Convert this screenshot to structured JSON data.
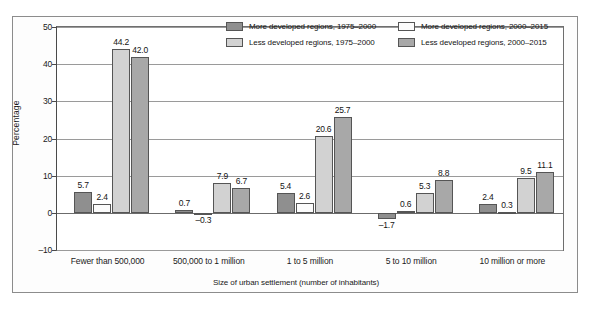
{
  "chart_data": {
    "type": "bar",
    "title": "",
    "xlabel": "Size of urban settlement (number of inhabitants)",
    "ylabel": "Percentage",
    "ylim": [
      -10,
      50
    ],
    "yticks": [
      -10,
      0,
      10,
      20,
      30,
      40,
      50
    ],
    "ytick_labels": [
      "–10",
      "0",
      "10",
      "20",
      "30",
      "40",
      "50"
    ],
    "grid": true,
    "legend_position": "top-right-inside",
    "categories": [
      "Fewer than 500,000",
      "500,000 to 1 million",
      "1 to 5 million",
      "5 to 10 million",
      "10 million or more"
    ],
    "series": [
      {
        "name": "More developed regions, 1975–2000",
        "color": "#8f8f8f",
        "values": [
          5.7,
          0.7,
          5.4,
          -1.7,
          2.4
        ],
        "labels": [
          "5.7",
          "0.7",
          "5.4",
          "–1.7",
          "2.4"
        ]
      },
      {
        "name": "More developed regions, 2000–2015",
        "color": "#fbfbfb",
        "values": [
          2.4,
          -0.3,
          2.6,
          0.6,
          0.3
        ],
        "labels": [
          "2.4",
          "–0.3",
          "2.6",
          "0.6",
          "0.3"
        ]
      },
      {
        "name": "Less developed regions, 1975–2000",
        "color": "#d2d2d2",
        "values": [
          44.2,
          7.9,
          20.6,
          5.3,
          9.5
        ],
        "labels": [
          "44.2",
          "7.9",
          "20.6",
          "5.3",
          "9.5"
        ]
      },
      {
        "name": "Less developed regions, 2000–2015",
        "color": "#a8a8a8",
        "values": [
          42.0,
          6.7,
          25.7,
          8.8,
          11.1
        ],
        "labels": [
          "42.0",
          "6.7",
          "25.7",
          "8.8",
          "11.1"
        ]
      }
    ]
  },
  "legend": {
    "entries": [
      {
        "label": "More developed regions, 1975–2000",
        "series": 0
      },
      {
        "label": "Less developed regions, 1975–2000",
        "series": 2
      },
      {
        "label": "More developed regions, 2000–2015",
        "series": 1
      },
      {
        "label": "Less developed regions, 2000–2015",
        "series": 3
      }
    ]
  }
}
